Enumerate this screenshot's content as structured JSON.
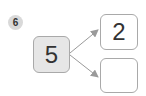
{
  "problem_number": "6",
  "diagram": {
    "source_value": "5",
    "targets": [
      {
        "value": "2"
      },
      {
        "value": ""
      }
    ],
    "colors": {
      "badge": "#d9d9d9",
      "source_fill": "#e6e6e6",
      "border": "#a9a9a9",
      "arrow": "#9a9a9a"
    }
  }
}
